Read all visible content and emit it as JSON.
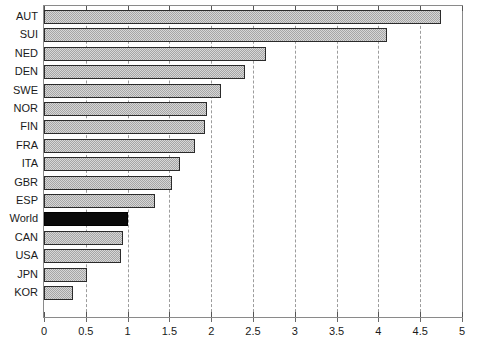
{
  "chart_data": {
    "type": "bar",
    "orientation": "horizontal",
    "title": "",
    "subtitle": "",
    "xlabel": "",
    "ylabel": "",
    "xlim": [
      0,
      5
    ],
    "ylim": null,
    "grid": "vertical-dashed",
    "legend": null,
    "xticks": [
      "0",
      "0.5",
      "1",
      "1.5",
      "2",
      "2.5",
      "3",
      "3.5",
      "4",
      "4.5",
      "5"
    ],
    "xtick_values": [
      0,
      0.5,
      1,
      1.5,
      2,
      2.5,
      3,
      3.5,
      4,
      4.5,
      5
    ],
    "categories": [
      "AUT",
      "SUI",
      "NED",
      "DEN",
      "SWE",
      "NOR",
      "FIN",
      "FRA",
      "ITA",
      "GBR",
      "ESP",
      "World",
      "CAN",
      "USA",
      "JPN",
      "KOR"
    ],
    "values": [
      4.75,
      4.1,
      2.65,
      2.4,
      2.12,
      1.95,
      1.92,
      1.81,
      1.63,
      1.53,
      1.33,
      1.0,
      0.95,
      0.92,
      0.52,
      0.35
    ],
    "highlight_category": "World",
    "colors": {
      "bar_fill": "#a6a6a6",
      "bar_edge": "#2b2b2b",
      "highlight_fill": "#0a0a0a",
      "gridline": "#9c9c9c",
      "frame": "#8a8a8a",
      "text": "#1a1a1a",
      "background": "#ffffff"
    }
  }
}
